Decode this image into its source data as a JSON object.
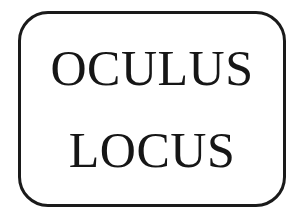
{
  "logo": {
    "type": "wordmark-in-rounded-rectangle",
    "lines": [
      {
        "text": "OCULUS"
      },
      {
        "text": "LOCUS"
      }
    ],
    "full_text": "OCULUS LOCUS",
    "colors": {
      "text": "#161616",
      "border": "#1a1a1a",
      "background": "#ffffff"
    },
    "frame": {
      "shape": "rounded-rectangle",
      "corner_radius_px": 30,
      "stroke_width_px": 3
    }
  }
}
